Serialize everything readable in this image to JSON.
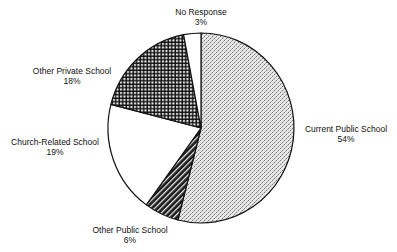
{
  "chart_data": {
    "type": "pie",
    "title": "",
    "start_angle_deg": 0,
    "direction": "clockwise",
    "slices": [
      {
        "label": "Current Public School",
        "value": 54,
        "display": "54%",
        "pattern": "dotted-crosshatch-gray"
      },
      {
        "label": "Other Public School",
        "value": 6,
        "display": "6%",
        "pattern": "dark-diagonal-stripes"
      },
      {
        "label": "Church-Related School",
        "value": 19,
        "display": "19%",
        "pattern": "white"
      },
      {
        "label": "Other Private School",
        "value": 18,
        "display": "18%",
        "pattern": "black-grid"
      },
      {
        "label": "No Response",
        "value": 3,
        "display": "3%",
        "pattern": "white"
      }
    ],
    "labels_position": "outside",
    "legend": "none"
  },
  "labels": {
    "current_public": {
      "name": "Current Public School",
      "pct": "54%"
    },
    "other_public": {
      "name": "Other Public School",
      "pct": "6%"
    },
    "church_related": {
      "name": "Church-Related School",
      "pct": "19%"
    },
    "other_private": {
      "name": "Other Private School",
      "pct": "18%"
    },
    "no_response": {
      "name": "No Response",
      "pct": "3%"
    }
  }
}
